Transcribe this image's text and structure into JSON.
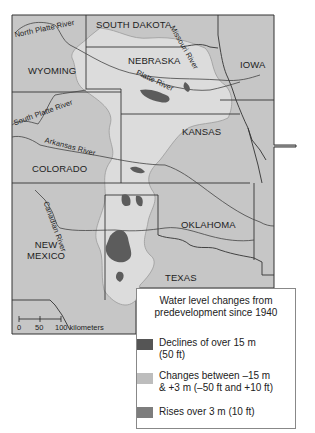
{
  "map": {
    "states": [
      {
        "name": "SOUTH DAKOTA",
        "x": 96,
        "y": 22
      },
      {
        "name": "WYOMING",
        "x": 29,
        "y": 65
      },
      {
        "name": "NEBRASKA",
        "x": 130,
        "y": 58
      },
      {
        "name": "IOWA",
        "x": 240,
        "y": 58
      },
      {
        "name": "KANSAS",
        "x": 182,
        "y": 125
      },
      {
        "name": "COLORADO",
        "x": 32,
        "y": 163
      },
      {
        "name": "OKLAHOMA",
        "x": 180,
        "y": 217
      },
      {
        "name": "NEW MEXICO",
        "x": 26,
        "y": 237
      },
      {
        "name": "TEXAS",
        "x": 165,
        "y": 270
      }
    ],
    "rivers": [
      {
        "name": "North Platte River"
      },
      {
        "name": "Missouri River"
      },
      {
        "name": "Platte River"
      },
      {
        "name": "South Platte River"
      },
      {
        "name": "Arkansas River"
      },
      {
        "name": "Canadian River"
      }
    ],
    "labels": {
      "south_dakota": "SOUTH DAKOTA",
      "wyoming": "WYOMING",
      "nebraska": "NEBRASKA",
      "iowa": "IOWA",
      "kansas": "KANSAS",
      "colorado": "COLORADO",
      "oklahoma": "OKLAHOMA",
      "new_mexico_1": "NEW",
      "new_mexico_2": "MEXICO",
      "texas": "TEXAS",
      "north_platte": "North Platte River",
      "missouri": "Missouri River",
      "platte": "Platte River",
      "south_platte": "South Platte River",
      "arkansas": "Arkansas River",
      "canadian": "Canadian River"
    },
    "scale_bar": {
      "ticks": [
        "0",
        "50",
        "100 kilometers"
      ]
    },
    "colors": {
      "background": "#c8c8c8",
      "aquifer": "#dedede",
      "decline": "#5e5e5e",
      "rise": "#7a7a7a",
      "border": "#333333"
    }
  },
  "legend": {
    "title_line1": "Water level changes from",
    "title_line2": "predevelopment since 1940",
    "items": [
      {
        "line1": "Declines of over 15 m",
        "line2": "(50 ft)",
        "color": "#555555"
      },
      {
        "line1": "Changes between –15 m",
        "line2": "& +3 m (–50 ft and +10 ft)",
        "color": "#bdbdbd"
      },
      {
        "line1": "Rises over 3 m (10 ft)",
        "line2": "",
        "color": "#7d7d7d"
      }
    ]
  }
}
